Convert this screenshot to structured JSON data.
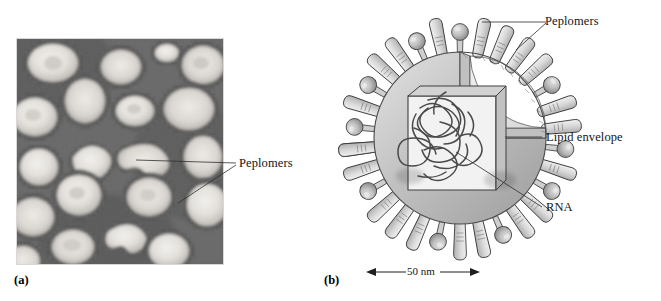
{
  "figure": {
    "panels": [
      {
        "id": "a",
        "letter": "(a)",
        "type": "electron-micrograph",
        "caption_label": "Peplomers"
      },
      {
        "id": "b",
        "letter": "(b)",
        "type": "schematic-diagram",
        "labels": {
          "peplomers": "Peplomers",
          "lipid_envelope": "Lipid envelope",
          "rna": "RNA"
        },
        "scale_bar": {
          "text": "50 nm",
          "value": 50,
          "unit": "nm"
        }
      }
    ]
  },
  "colors": {
    "background": "#ffffff",
    "micrograph_dark": "#5e5e5e",
    "micrograph_light": "#e8e6e2",
    "envelope_light": "#d5d5d5",
    "envelope_mid": "#b4b4b4",
    "envelope_dark": "#9a9a9a",
    "spike_fill": "#dcdcdc",
    "sphere_fill": "#b9b9b9",
    "outline": "#3c3c3c",
    "label_text": "#141414",
    "leader_line": "#3a3a3a"
  }
}
